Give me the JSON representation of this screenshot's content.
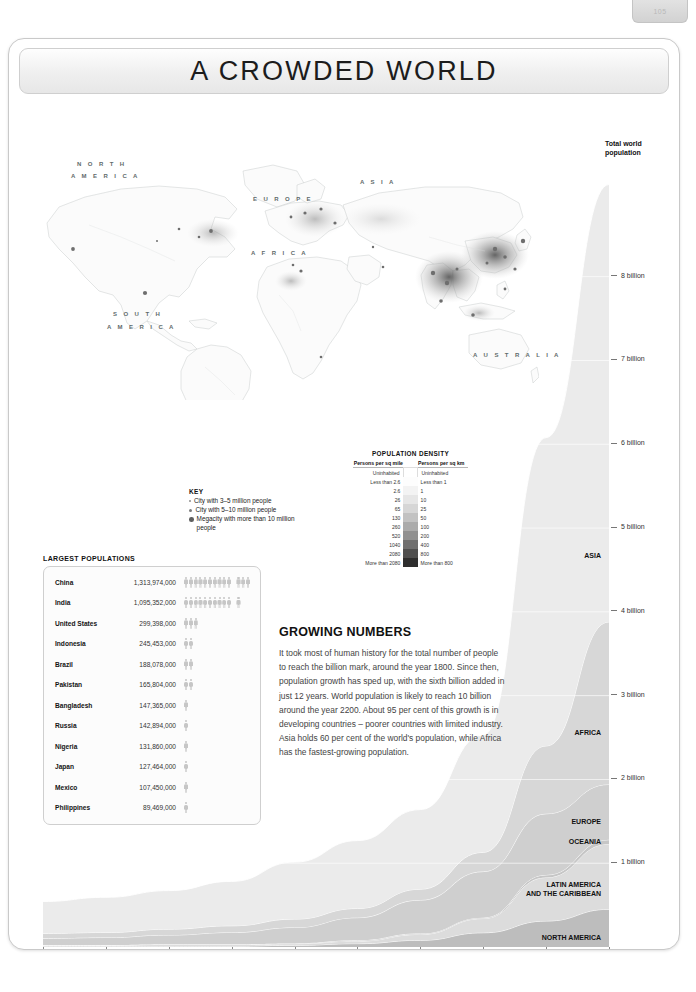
{
  "page_tab": {
    "label": "105"
  },
  "header": {
    "title": "A CROWDED WORLD"
  },
  "map": {
    "continent_labels": [
      {
        "text": "N O R T H",
        "x": 62,
        "y": 148
      },
      {
        "text": "A M E R I C A",
        "x": 56,
        "y": 160
      },
      {
        "text": "S O U T H",
        "x": 98,
        "y": 298
      },
      {
        "text": "A M E R I C A",
        "x": 92,
        "y": 311
      },
      {
        "text": "E U R O P E",
        "x": 238,
        "y": 183
      },
      {
        "text": "A S I A",
        "x": 345,
        "y": 166
      },
      {
        "text": "A F R I C A",
        "x": 236,
        "y": 237
      },
      {
        "text": "A U S T R A L I A",
        "x": 458,
        "y": 339
      }
    ]
  },
  "key": {
    "title": "KEY",
    "items": [
      "City with 3–5 million people",
      "City with 5–10 million people",
      "Megacity with more than 10 million people"
    ]
  },
  "density": {
    "title": "POPULATION DENSITY",
    "col_left": "Persons per sq mile",
    "col_right": "Persons per sq km",
    "rows": [
      {
        "mile": "Uninhabited",
        "km": "Uninhabited",
        "color": "#ffffff"
      },
      {
        "mile": "Less than 2.6",
        "km": "Less than 1",
        "color": "#fdfdfd"
      },
      {
        "mile": "2.6",
        "km": "1",
        "color": "#f3f3f3"
      },
      {
        "mile": "26",
        "km": "10",
        "color": "#e6e6e6"
      },
      {
        "mile": "65",
        "km": "25",
        "color": "#d6d6d6"
      },
      {
        "mile": "130",
        "km": "50",
        "color": "#c2c2c2"
      },
      {
        "mile": "260",
        "km": "100",
        "color": "#ababab"
      },
      {
        "mile": "520",
        "km": "200",
        "color": "#919191"
      },
      {
        "mile": "1040",
        "km": "400",
        "color": "#6f6f6f"
      },
      {
        "mile": "2080",
        "km": "800",
        "color": "#4f4f4f"
      },
      {
        "mile": "More than 2080",
        "km": "More than 800",
        "color": "#2e2e2e"
      }
    ]
  },
  "largest_populations": {
    "title": "LARGEST POPULATIONS",
    "figure_value": 100000000,
    "rows": [
      {
        "country": "China",
        "population": "1,313,974,000",
        "figures": 13
      },
      {
        "country": "India",
        "population": "1,095,352,000",
        "figures": 11
      },
      {
        "country": "United States",
        "population": "299,398,000",
        "figures": 3
      },
      {
        "country": "Indonesia",
        "population": "245,453,000",
        "figures": 2
      },
      {
        "country": "Brazil",
        "population": "188,078,000",
        "figures": 2
      },
      {
        "country": "Pakistan",
        "population": "165,804,000",
        "figures": 2
      },
      {
        "country": "Bangladesh",
        "population": "147,365,000",
        "figures": 1
      },
      {
        "country": "Russia",
        "population": "142,894,000",
        "figures": 1
      },
      {
        "country": "Nigeria",
        "population": "131,860,000",
        "figures": 1
      },
      {
        "country": "Japan",
        "population": "127,464,000",
        "figures": 1
      },
      {
        "country": "Mexico",
        "population": "107,450,000",
        "figures": 1
      },
      {
        "country": "Philippines",
        "population": "89,469,000",
        "figures": 1
      }
    ]
  },
  "growing_numbers": {
    "title": "GROWING NUMBERS",
    "body": "It took most of human history for the total number of people to reach the billion mark, around the year 1800. Since then, population growth has sped up, with the sixth billion added in just 12 years. World population is likely to reach 10 billion around the year 2200. About 95 per cent of this growth is in developing countries – poorer countries with limited industry. Asia holds 60 per cent of the world's population, while Africa has the fastest-growing population."
  },
  "chart_data": {
    "type": "area",
    "title": "Total world population",
    "xlabel": "Year",
    "ylabel": "Total world population",
    "xlim": [
      1600,
      2050
    ],
    "ylim": [
      0,
      9.5
    ],
    "y_unit": "billion",
    "x_ticks": [
      "1600",
      "1650",
      "1700",
      "1750",
      "1800",
      "1850",
      "1900",
      "1950",
      "2000",
      "2050"
    ],
    "y_ticks": [
      "1 billion",
      "2 billion",
      "3 billion",
      "4 billion",
      "5 billion",
      "6 billion",
      "7 billion",
      "8 billion"
    ],
    "y_tick_values": [
      1,
      2,
      3,
      4,
      5,
      6,
      7,
      8
    ],
    "grid": false,
    "legend_position": "inline-right",
    "stacked": true,
    "x": [
      1600,
      1650,
      1700,
      1750,
      1800,
      1850,
      1900,
      1950,
      2000,
      2050
    ],
    "series": [
      {
        "name": "NORTH AMERICA",
        "color": "#bdbdbd",
        "values": [
          0.01,
          0.01,
          0.01,
          0.01,
          0.02,
          0.04,
          0.08,
          0.17,
          0.31,
          0.45
        ]
      },
      {
        "name": "LATIN AMERICA AND THE CARIBBEAN",
        "color": "#dcdcdc",
        "values": [
          0.01,
          0.01,
          0.02,
          0.02,
          0.02,
          0.03,
          0.07,
          0.17,
          0.52,
          0.78
        ]
      },
      {
        "name": "OCEANIA",
        "color": "#c6c6c6",
        "values": [
          0.003,
          0.003,
          0.003,
          0.003,
          0.003,
          0.01,
          0.01,
          0.01,
          0.03,
          0.05
        ]
      },
      {
        "name": "EUROPE",
        "color": "#cfcfcf",
        "values": [
          0.08,
          0.09,
          0.11,
          0.14,
          0.19,
          0.27,
          0.4,
          0.55,
          0.73,
          0.66
        ]
      },
      {
        "name": "AFRICA",
        "color": "#d7d7d7",
        "values": [
          0.06,
          0.06,
          0.07,
          0.08,
          0.1,
          0.11,
          0.13,
          0.23,
          0.81,
          1.94
        ]
      },
      {
        "name": "ASIA",
        "color": "#ebebeb",
        "values": [
          0.38,
          0.42,
          0.46,
          0.53,
          0.68,
          0.81,
          0.95,
          1.4,
          3.68,
          5.22
        ]
      }
    ]
  }
}
